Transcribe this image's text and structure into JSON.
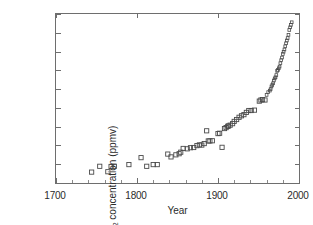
{
  "chart_data": {
    "type": "scatter",
    "title": "",
    "xlabel": "Year",
    "ylabel": "CO2 concentration (ppmv)",
    "ylabel_rich": {
      "prefix": "CO",
      "sub": "2",
      "suffix": " concentration (ppmv)"
    },
    "xlim": [
      1700,
      2000
    ],
    "ylim": [
      270,
      360
    ],
    "xticks": [
      1700,
      1800,
      1900,
      2000
    ],
    "yticks": [
      270,
      280,
      290,
      300,
      310,
      320,
      330,
      340,
      350,
      360
    ],
    "xminor_step": 20,
    "grid": false,
    "legend": null,
    "marker": "open-square",
    "marker_color": "#4a4a4a",
    "series": [
      {
        "name": "CO2 concentration",
        "points": [
          [
            1744,
            275.8
          ],
          [
            1754,
            278.9
          ],
          [
            1764,
            276.0
          ],
          [
            1768,
            278.8
          ],
          [
            1772,
            278.9
          ],
          [
            1790,
            279.8
          ],
          [
            1805,
            283.5
          ],
          [
            1812,
            278.9
          ],
          [
            1820,
            279.8
          ],
          [
            1825,
            279.8
          ],
          [
            1838,
            285.4
          ],
          [
            1842,
            283.9
          ],
          [
            1848,
            285.0
          ],
          [
            1852,
            285.6
          ],
          [
            1854,
            286.4
          ],
          [
            1857,
            288.4
          ],
          [
            1862,
            288.2
          ],
          [
            1866,
            288.8
          ],
          [
            1870,
            288.9
          ],
          [
            1874,
            289.9
          ],
          [
            1877,
            290.3
          ],
          [
            1880,
            290.2
          ],
          [
            1883,
            291.0
          ],
          [
            1886,
            297.8
          ],
          [
            1888,
            292.4
          ],
          [
            1890,
            292.4
          ],
          [
            1893,
            292.5
          ],
          [
            1900,
            296.3
          ],
          [
            1902,
            296.5
          ],
          [
            1905,
            289.0
          ],
          [
            1908,
            299.0
          ],
          [
            1910,
            299.5
          ],
          [
            1912,
            300.2
          ],
          [
            1913,
            300.4
          ],
          [
            1915,
            300.8
          ],
          [
            1918,
            301.6
          ],
          [
            1920,
            302.8
          ],
          [
            1923,
            303.8
          ],
          [
            1926,
            305.0
          ],
          [
            1929,
            305.8
          ],
          [
            1932,
            306.4
          ],
          [
            1935,
            307.6
          ],
          [
            1938,
            308.6
          ],
          [
            1941,
            308.6
          ],
          [
            1945,
            308.8
          ],
          [
            1951,
            313.6
          ],
          [
            1953,
            314.2
          ],
          [
            1955,
            314.4
          ],
          [
            1958,
            314.2
          ],
          [
            1960,
            316.9
          ],
          [
            1962,
            318.4
          ],
          [
            1964,
            319.2
          ],
          [
            1965,
            320.0
          ],
          [
            1966,
            321.4
          ],
          [
            1967,
            322.2
          ],
          [
            1968,
            323.1
          ],
          [
            1969,
            324.6
          ],
          [
            1970,
            325.7
          ],
          [
            1971,
            326.3
          ],
          [
            1972,
            327.5
          ],
          [
            1973,
            329.7
          ],
          [
            1974,
            330.2
          ],
          [
            1975,
            331.1
          ],
          [
            1976,
            332.0
          ],
          [
            1977,
            333.8
          ],
          [
            1978,
            335.4
          ],
          [
            1979,
            336.8
          ],
          [
            1980,
            338.7
          ],
          [
            1981,
            339.9
          ],
          [
            1982,
            341.1
          ],
          [
            1983,
            342.8
          ],
          [
            1984,
            344.4
          ],
          [
            1985,
            345.9
          ],
          [
            1986,
            347.2
          ],
          [
            1987,
            348.9
          ],
          [
            1988,
            351.5
          ],
          [
            1989,
            352.9
          ],
          [
            1990,
            354.2
          ],
          [
            1991,
            355.6
          ]
        ]
      }
    ]
  }
}
